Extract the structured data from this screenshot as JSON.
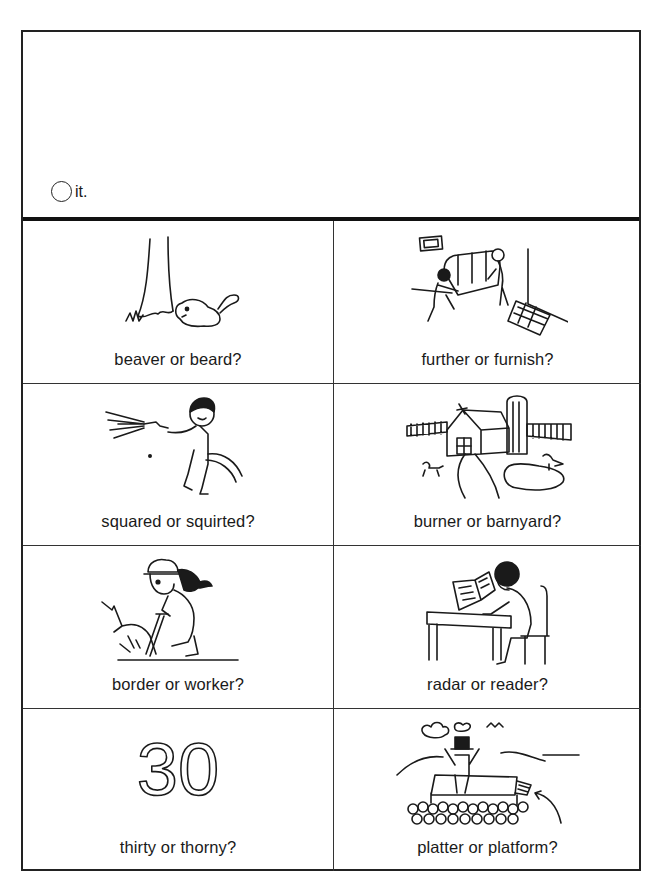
{
  "header": {
    "instruction_suffix": "it.",
    "instruction_icon": "blank-circle-icon"
  },
  "items": [
    {
      "label": "beaver or beard?",
      "picture": "beaver-by-tree",
      "answer_options": [
        "beaver",
        "beard"
      ]
    },
    {
      "label": "further or furnish?",
      "picture": "people-moving-couch",
      "answer_options": [
        "further",
        "furnish"
      ]
    },
    {
      "label": "squared or squirted?",
      "picture": "boy-with-hose",
      "answer_options": [
        "squared",
        "squirted"
      ]
    },
    {
      "label": "burner or barnyard?",
      "picture": "farm-barn-silo",
      "answer_options": [
        "burner",
        "barnyard"
      ]
    },
    {
      "label": "border or worker?",
      "picture": "worker-with-jackhammer",
      "answer_options": [
        "border",
        "worker"
      ]
    },
    {
      "label": "radar or reader?",
      "picture": "boy-reading-at-desk",
      "answer_options": [
        "radar",
        "reader"
      ]
    },
    {
      "label": "thirty or thorny?",
      "picture": "number-30",
      "answer_options": [
        "thirty",
        "thorny"
      ],
      "picture_text": "30"
    },
    {
      "label": "platter or platform?",
      "picture": "man-on-stage-platform",
      "answer_options": [
        "platter",
        "platform"
      ]
    }
  ]
}
